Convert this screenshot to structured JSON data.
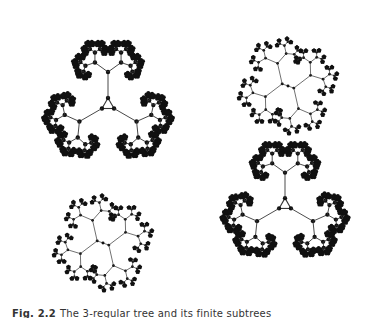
{
  "figure": {
    "caption_label": "Fig. 2.2",
    "caption_text": "The 3-regular tree and its finite subtrees",
    "colors": {
      "background": "#ffffff",
      "ink": "#111111",
      "edge": "#333333"
    },
    "trees": [
      {
        "id": "tree-large-top-left",
        "type": "triangle-rooted",
        "cx": 108,
        "cy": 105,
        "scale": 1.0,
        "rotation": 0,
        "depth": 5
      },
      {
        "id": "tree-large-bottom-right",
        "type": "triangle-rooted",
        "cx": 285,
        "cy": 205,
        "scale": 0.98,
        "rotation": 0,
        "depth": 5
      },
      {
        "id": "tree-small-top-right",
        "type": "edge-rooted",
        "cx": 288,
        "cy": 86,
        "scale": 0.62,
        "rotation": 20,
        "depth": 4
      },
      {
        "id": "tree-small-bottom-left",
        "type": "edge-rooted",
        "cx": 103,
        "cy": 243,
        "scale": 0.62,
        "rotation": 20,
        "depth": 4
      }
    ]
  }
}
